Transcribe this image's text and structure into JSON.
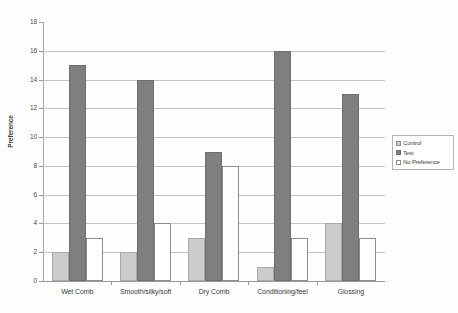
{
  "chart_data": {
    "type": "bar",
    "title": "",
    "xlabel": "",
    "ylabel": "Preference",
    "ylim": [
      0,
      18
    ],
    "ytick_step": 2,
    "yticks": [
      0,
      2,
      4,
      6,
      8,
      10,
      12,
      14,
      16,
      18
    ],
    "gridlines": [
      2,
      4,
      6,
      8,
      10,
      12,
      14,
      16
    ],
    "grid": true,
    "legend_position": "right",
    "categories": [
      "Wet Comb",
      "Smooth/silky/soft",
      "Dry Comb",
      "Conditioning/feel",
      "Glossing"
    ],
    "series": [
      {
        "name": "Control",
        "color": "#cccccc",
        "values": [
          2,
          2,
          3,
          1,
          4
        ]
      },
      {
        "name": "Test",
        "color": "#7f7f7f",
        "values": [
          15,
          14,
          9,
          16,
          13
        ]
      },
      {
        "name": "No Preference",
        "color": "#ffffff",
        "values": [
          3,
          4,
          8,
          3,
          3
        ]
      }
    ]
  },
  "legend": {
    "items": [
      {
        "label": "Control"
      },
      {
        "label": "Test"
      },
      {
        "label": "No Preference"
      }
    ]
  },
  "axis": {
    "y_title": "Preference"
  }
}
